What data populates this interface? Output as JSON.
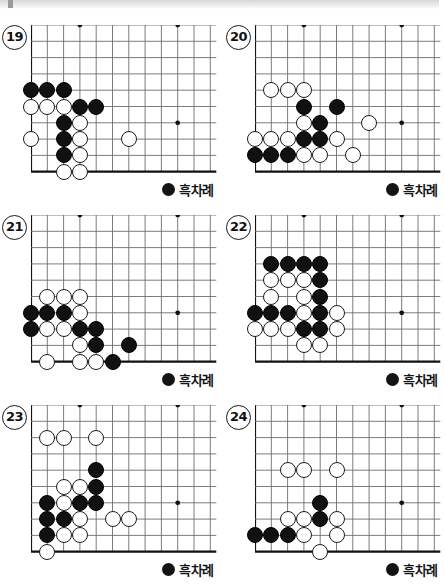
{
  "page": {
    "turn_label": "흑차례",
    "turn_stone_icon": "black-stone-icon",
    "colors": {
      "black_stone": "#111111",
      "white_stone": "#ffffff",
      "stone_outline": "#1c1c1c",
      "grid_line": "#6d6d6d",
      "board_edge": "#111111",
      "top_band": "#d8d8d8"
    }
  },
  "board_geometry": {
    "cols": 12,
    "rows": 10,
    "spacing": 16.3,
    "stone_diameter": 16,
    "star_points": [
      [
        3,
        0
      ],
      [
        9,
        0
      ],
      [
        9,
        6
      ]
    ],
    "edge_left_col": 0,
    "edge_bottom_row": 9,
    "note": "col 0 = left board edge, row 9 = bottom board edge; star points on 4th lines"
  },
  "problems": [
    {
      "number": "19",
      "turn": "흑차례",
      "stones": [
        {
          "c": 0,
          "r": 4,
          "color": "b"
        },
        {
          "c": 1,
          "r": 4,
          "color": "b"
        },
        {
          "c": 2,
          "r": 4,
          "color": "b"
        },
        {
          "c": 0,
          "r": 5,
          "color": "w"
        },
        {
          "c": 1,
          "r": 5,
          "color": "w"
        },
        {
          "c": 2,
          "r": 5,
          "color": "w"
        },
        {
          "c": 3,
          "r": 5,
          "color": "b"
        },
        {
          "c": 4,
          "r": 5,
          "color": "b"
        },
        {
          "c": 2,
          "r": 6,
          "color": "b"
        },
        {
          "c": 3,
          "r": 6,
          "color": "w"
        },
        {
          "c": 0,
          "r": 7,
          "color": "w"
        },
        {
          "c": 2,
          "r": 7,
          "color": "b"
        },
        {
          "c": 3,
          "r": 7,
          "color": "w"
        },
        {
          "c": 6,
          "r": 7,
          "color": "w"
        },
        {
          "c": 2,
          "r": 8,
          "color": "b"
        },
        {
          "c": 3,
          "r": 8,
          "color": "w"
        },
        {
          "c": 2,
          "r": 9,
          "color": "w"
        },
        {
          "c": 3,
          "r": 9,
          "color": "w"
        }
      ]
    },
    {
      "number": "20",
      "turn": "흑차례",
      "stones": [
        {
          "c": 1,
          "r": 4,
          "color": "w"
        },
        {
          "c": 2,
          "r": 4,
          "color": "w"
        },
        {
          "c": 3,
          "r": 4,
          "color": "w"
        },
        {
          "c": 3,
          "r": 5,
          "color": "b"
        },
        {
          "c": 5,
          "r": 5,
          "color": "b"
        },
        {
          "c": 3,
          "r": 6,
          "color": "w"
        },
        {
          "c": 4,
          "r": 6,
          "color": "b"
        },
        {
          "c": 7,
          "r": 6,
          "color": "w"
        },
        {
          "c": 0,
          "r": 7,
          "color": "w"
        },
        {
          "c": 1,
          "r": 7,
          "color": "w"
        },
        {
          "c": 2,
          "r": 7,
          "color": "w"
        },
        {
          "c": 3,
          "r": 7,
          "color": "b"
        },
        {
          "c": 4,
          "r": 7,
          "color": "b"
        },
        {
          "c": 5,
          "r": 7,
          "color": "w"
        },
        {
          "c": 0,
          "r": 8,
          "color": "b"
        },
        {
          "c": 1,
          "r": 8,
          "color": "b"
        },
        {
          "c": 2,
          "r": 8,
          "color": "b"
        },
        {
          "c": 3,
          "r": 8,
          "color": "w"
        },
        {
          "c": 4,
          "r": 8,
          "color": "w"
        },
        {
          "c": 6,
          "r": 8,
          "color": "w"
        }
      ]
    },
    {
      "number": "21",
      "turn": "흑차례",
      "stones": [
        {
          "c": 1,
          "r": 5,
          "color": "w"
        },
        {
          "c": 2,
          "r": 5,
          "color": "w"
        },
        {
          "c": 3,
          "r": 5,
          "color": "w"
        },
        {
          "c": 0,
          "r": 6,
          "color": "b"
        },
        {
          "c": 1,
          "r": 6,
          "color": "b"
        },
        {
          "c": 2,
          "r": 6,
          "color": "b"
        },
        {
          "c": 3,
          "r": 6,
          "color": "w"
        },
        {
          "c": 0,
          "r": 7,
          "color": "b"
        },
        {
          "c": 1,
          "r": 7,
          "color": "w"
        },
        {
          "c": 2,
          "r": 7,
          "color": "w"
        },
        {
          "c": 3,
          "r": 7,
          "color": "b"
        },
        {
          "c": 4,
          "r": 7,
          "color": "b"
        },
        {
          "c": 3,
          "r": 8,
          "color": "w"
        },
        {
          "c": 4,
          "r": 8,
          "color": "b"
        },
        {
          "c": 6,
          "r": 8,
          "color": "b"
        },
        {
          "c": 1,
          "r": 9,
          "color": "w"
        },
        {
          "c": 3,
          "r": 9,
          "color": "w"
        },
        {
          "c": 4,
          "r": 9,
          "color": "w"
        },
        {
          "c": 5,
          "r": 9,
          "color": "b"
        }
      ]
    },
    {
      "number": "22",
      "turn": "흑차례",
      "stones": [
        {
          "c": 1,
          "r": 3,
          "color": "b"
        },
        {
          "c": 2,
          "r": 3,
          "color": "b"
        },
        {
          "c": 3,
          "r": 3,
          "color": "b"
        },
        {
          "c": 4,
          "r": 3,
          "color": "b"
        },
        {
          "c": 1,
          "r": 4,
          "color": "w"
        },
        {
          "c": 2,
          "r": 4,
          "color": "w"
        },
        {
          "c": 3,
          "r": 4,
          "color": "w"
        },
        {
          "c": 4,
          "r": 4,
          "color": "b"
        },
        {
          "c": 1,
          "r": 5,
          "color": "w"
        },
        {
          "c": 3,
          "r": 5,
          "color": "w"
        },
        {
          "c": 4,
          "r": 5,
          "color": "b"
        },
        {
          "c": 0,
          "r": 6,
          "color": "b"
        },
        {
          "c": 1,
          "r": 6,
          "color": "b"
        },
        {
          "c": 2,
          "r": 6,
          "color": "b"
        },
        {
          "c": 3,
          "r": 6,
          "color": "w"
        },
        {
          "c": 4,
          "r": 6,
          "color": "b"
        },
        {
          "c": 5,
          "r": 6,
          "color": "w"
        },
        {
          "c": 0,
          "r": 7,
          "color": "w"
        },
        {
          "c": 1,
          "r": 7,
          "color": "w"
        },
        {
          "c": 2,
          "r": 7,
          "color": "w"
        },
        {
          "c": 3,
          "r": 7,
          "color": "b"
        },
        {
          "c": 4,
          "r": 7,
          "color": "b"
        },
        {
          "c": 5,
          "r": 7,
          "color": "w"
        },
        {
          "c": 3,
          "r": 8,
          "color": "w"
        },
        {
          "c": 4,
          "r": 8,
          "color": "w"
        }
      ]
    },
    {
      "number": "23",
      "turn": "흑차례",
      "stones": [
        {
          "c": 1,
          "r": 2,
          "color": "w"
        },
        {
          "c": 2,
          "r": 2,
          "color": "w"
        },
        {
          "c": 4,
          "r": 2,
          "color": "w"
        },
        {
          "c": 4,
          "r": 4,
          "color": "b"
        },
        {
          "c": 2,
          "r": 5,
          "color": "w"
        },
        {
          "c": 3,
          "r": 5,
          "color": "w"
        },
        {
          "c": 4,
          "r": 5,
          "color": "b"
        },
        {
          "c": 1,
          "r": 6,
          "color": "b"
        },
        {
          "c": 2,
          "r": 6,
          "color": "w"
        },
        {
          "c": 3,
          "r": 6,
          "color": "b"
        },
        {
          "c": 4,
          "r": 6,
          "color": "b"
        },
        {
          "c": 1,
          "r": 7,
          "color": "b"
        },
        {
          "c": 2,
          "r": 7,
          "color": "b"
        },
        {
          "c": 3,
          "r": 7,
          "color": "w"
        },
        {
          "c": 5,
          "r": 7,
          "color": "w"
        },
        {
          "c": 6,
          "r": 7,
          "color": "w"
        },
        {
          "c": 1,
          "r": 8,
          "color": "b"
        },
        {
          "c": 2,
          "r": 8,
          "color": "w"
        },
        {
          "c": 3,
          "r": 8,
          "color": "w"
        },
        {
          "c": 1,
          "r": 9,
          "color": "w"
        }
      ]
    },
    {
      "number": "24",
      "turn": "흑차례",
      "stones": [
        {
          "c": 2,
          "r": 4,
          "color": "w"
        },
        {
          "c": 3,
          "r": 4,
          "color": "w"
        },
        {
          "c": 5,
          "r": 4,
          "color": "w"
        },
        {
          "c": 4,
          "r": 6,
          "color": "b"
        },
        {
          "c": 2,
          "r": 7,
          "color": "w"
        },
        {
          "c": 3,
          "r": 7,
          "color": "w"
        },
        {
          "c": 4,
          "r": 7,
          "color": "b"
        },
        {
          "c": 5,
          "r": 7,
          "color": "w"
        },
        {
          "c": 0,
          "r": 8,
          "color": "b"
        },
        {
          "c": 1,
          "r": 8,
          "color": "b"
        },
        {
          "c": 2,
          "r": 8,
          "color": "b"
        },
        {
          "c": 3,
          "r": 8,
          "color": "w"
        },
        {
          "c": 5,
          "r": 8,
          "color": "w"
        },
        {
          "c": 4,
          "r": 9,
          "color": "w"
        }
      ]
    }
  ],
  "layout": {
    "panel_positions": [
      {
        "left": 0,
        "top": 8
      },
      {
        "left": 224,
        "top": 8
      },
      {
        "left": 0,
        "top": 198
      },
      {
        "left": 224,
        "top": 198
      },
      {
        "left": 0,
        "top": 388
      },
      {
        "left": 224,
        "top": 388
      }
    ]
  }
}
